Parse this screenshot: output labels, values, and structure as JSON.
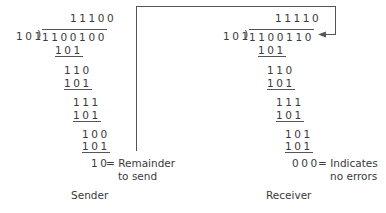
{
  "sender": {
    "title": "Sender",
    "divisor": "101",
    "quotient": "11100",
    "dividend": "1100100",
    "steps": [
      "101",
      "110",
      "101",
      "111",
      "101",
      "100",
      "101"
    ],
    "remainder": "10",
    "remainder_note_line1": "= Remainder",
    "remainder_note_line2": "to send"
  },
  "receiver": {
    "title": "Receiver",
    "divisor": "101",
    "quotient": "11110",
    "dividend": "1100110",
    "steps": [
      "101",
      "110",
      "101",
      "111",
      "101",
      "101",
      "101"
    ],
    "remainder": "000",
    "remainder_note_line1": "= Indicates",
    "remainder_note_line2": "no errors"
  },
  "colors": {
    "text": "#3a3a3a",
    "line": "#555555"
  }
}
